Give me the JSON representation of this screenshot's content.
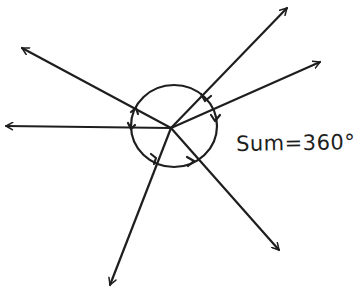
{
  "diagram": {
    "annotation": "Sum=360°",
    "center": {
      "x": 171,
      "y": 128
    },
    "circle": {
      "cx": 174,
      "cy": 126,
      "rx": 43,
      "ry": 41
    },
    "rays": [
      {
        "name": "ray-upper-right",
        "x2": 287,
        "y2": 8
      },
      {
        "name": "ray-right",
        "x2": 320,
        "y2": 62
      },
      {
        "name": "ray-upper-left",
        "x2": 22,
        "y2": 48
      },
      {
        "name": "ray-left",
        "x2": 6,
        "y2": 126
      },
      {
        "name": "ray-lower-left",
        "x2": 110,
        "y2": 285
      },
      {
        "name": "ray-lower-right",
        "x2": 279,
        "y2": 250
      }
    ],
    "angle_count": 6,
    "stroke_color": "#1e1e1e",
    "background": "#ffffff"
  }
}
